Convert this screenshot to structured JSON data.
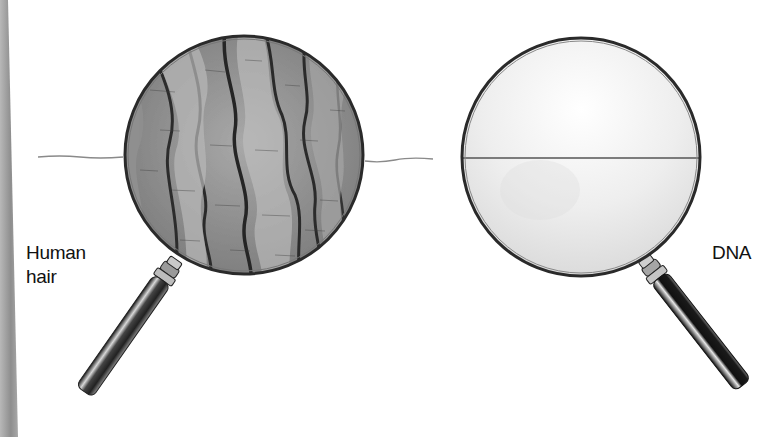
{
  "figure": {
    "left_panel": {
      "label_lines": [
        "Human",
        "hair"
      ],
      "subject": "human-hair",
      "lens_content": "magnified-hair-cuticle-scales"
    },
    "right_panel": {
      "label_lines": [
        "DNA"
      ],
      "subject": "dna",
      "lens_content": "thin-line-at-same-magnification"
    }
  },
  "colors": {
    "background": "#ffffff",
    "ink": "#111111",
    "lens_rim": "#333333",
    "hair_gray": "#8a8a8a",
    "edge_strip": "#9a9a9a"
  }
}
